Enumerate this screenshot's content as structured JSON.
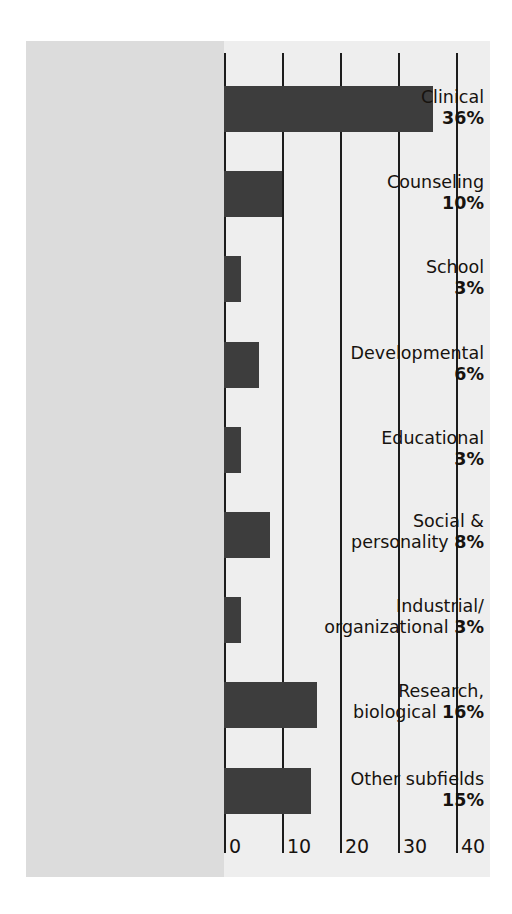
{
  "chart_data": {
    "type": "bar",
    "orientation": "horizontal",
    "title": "",
    "subtitle": "",
    "xlabel": "",
    "ylabel": "",
    "xlim": [
      0,
      45
    ],
    "xticks": [
      "0",
      "10",
      "20",
      "30",
      "40"
    ],
    "xtick_values": [
      0,
      10,
      20,
      30,
      40
    ],
    "grid": "vertical",
    "legend": "none",
    "categories": [
      "Clinical",
      "Counseling",
      "School",
      "Developmental",
      "Educational",
      "Social & personality",
      "Industrial/ organizational",
      "Research, biological",
      "Other subfields"
    ],
    "values": [
      36,
      10,
      3,
      6,
      3,
      8,
      3,
      16,
      15
    ],
    "value_labels": [
      "36%",
      "10%",
      "3%",
      "6%",
      "3%",
      "8%",
      "3%",
      "16%",
      "15%"
    ],
    "bars": [
      {
        "name": "Clinical",
        "label_line1": "Clinical",
        "label_line2": "",
        "percent": "36%",
        "value": 36
      },
      {
        "name": "Counseling",
        "label_line1": "Counseling",
        "label_line2": "",
        "percent": "10%",
        "value": 10
      },
      {
        "name": "School",
        "label_line1": "School",
        "label_line2": "",
        "percent": "3%",
        "value": 3
      },
      {
        "name": "Developmental",
        "label_line1": "Developmental",
        "label_line2": "",
        "percent": "6%",
        "value": 6
      },
      {
        "name": "Educational",
        "label_line1": "Educational",
        "label_line2": "",
        "percent": "3%",
        "value": 3
      },
      {
        "name": "Social & personality",
        "label_line1": "Social &",
        "label_line2": "personality",
        "percent": "8%",
        "value": 8
      },
      {
        "name": "Industrial/organizational",
        "label_line1": "Industrial/",
        "label_line2": "organizational",
        "percent": "3%",
        "value": 3
      },
      {
        "name": "Research, biological",
        "label_line1": "Research,",
        "label_line2": "biological",
        "percent": "16%",
        "value": 16
      },
      {
        "name": "Other subfields",
        "label_line1": "Other subfields",
        "label_line2": "",
        "percent": "15%",
        "value": 15
      }
    ],
    "colors": {
      "bar": "#3d3d3d",
      "label_band": "#dcdcdc",
      "plot_background": "#eeeeee",
      "gridline": "#1c1c1c",
      "text": "#17130f",
      "page_background": "#ffffff"
    }
  }
}
